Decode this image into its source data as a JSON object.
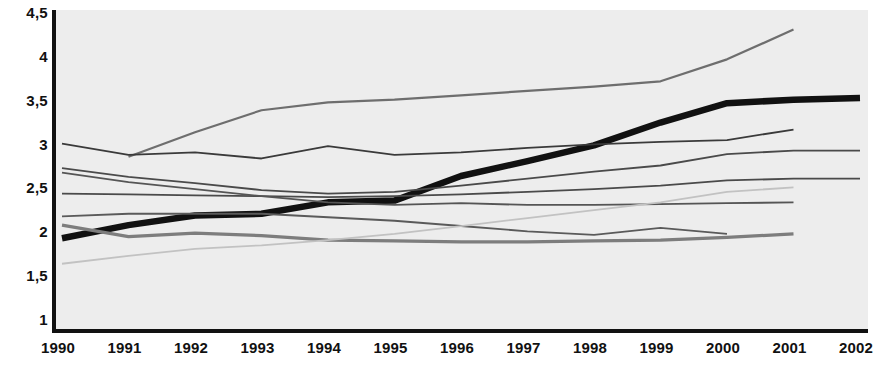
{
  "chart_data": {
    "type": "line",
    "title": "",
    "subtitle": "",
    "xlabel": "",
    "ylabel": "",
    "xlim": [
      1990,
      2002
    ],
    "ylim": [
      1,
      4.5
    ],
    "yticks": [
      1,
      1.5,
      2,
      2.5,
      3,
      3.5,
      4,
      4.5
    ],
    "ytick_labels": [
      "1",
      "1,5",
      "2",
      "2,5",
      "3",
      "3,5",
      "4",
      "4,5"
    ],
    "x": [
      1990,
      1991,
      1992,
      1993,
      1994,
      1995,
      1996,
      1997,
      1998,
      1999,
      2000,
      2001,
      2002
    ],
    "xtick_labels": [
      "1990",
      "1991",
      "1992",
      "1993",
      "1994",
      "1995",
      "1996",
      "1997",
      "1998",
      "1999",
      "2000",
      "2001",
      "2002"
    ],
    "grid": false,
    "legend": "none",
    "decimal_separator": ",",
    "plot_background": "#ededed",
    "axis_color": "#111111",
    "series": [
      {
        "name": "series-rising-top",
        "color": "#6e6e6e",
        "width": 2.2,
        "x": [
          1991,
          1992,
          1993,
          1994,
          1995,
          1996,
          1997,
          1998,
          1999,
          2000,
          2001
        ],
        "values": [
          2.85,
          3.13,
          3.38,
          3.47,
          3.5,
          3.55,
          3.6,
          3.65,
          3.71,
          3.96,
          4.3
        ]
      },
      {
        "name": "series-highlight-thick",
        "color": "#111111",
        "width": 6.5,
        "x": [
          1990,
          1991,
          1992,
          1993,
          1994,
          1995,
          1996,
          1997,
          1998,
          1999,
          2000,
          2001,
          2002
        ],
        "values": [
          1.92,
          2.07,
          2.18,
          2.2,
          2.33,
          2.35,
          2.63,
          2.8,
          2.98,
          3.24,
          3.46,
          3.5,
          3.52
        ]
      },
      {
        "name": "series-upper-wavy",
        "color": "#3a3a3a",
        "width": 1.8,
        "x": [
          1990,
          1991,
          1992,
          1993,
          1994,
          1995,
          1996,
          1997,
          1998,
          1999,
          2000,
          2001
        ],
        "values": [
          3.0,
          2.87,
          2.9,
          2.83,
          2.97,
          2.87,
          2.9,
          2.95,
          2.99,
          3.02,
          3.04,
          3.16
        ]
      },
      {
        "name": "series-upper-flat",
        "color": "#4a4a4a",
        "width": 1.8,
        "x": [
          1990,
          1991,
          1992,
          1993,
          1994,
          1995,
          1996,
          1997,
          1998,
          1999,
          2000,
          2001,
          2002
        ],
        "values": [
          2.72,
          2.62,
          2.55,
          2.47,
          2.43,
          2.45,
          2.52,
          2.6,
          2.68,
          2.75,
          2.88,
          2.92,
          2.92
        ]
      },
      {
        "name": "series-mid-rising",
        "color": "#4a4a4a",
        "width": 1.8,
        "x": [
          1990,
          1991,
          1992,
          1993,
          1994,
          1995,
          1996,
          1997,
          1998,
          1999,
          2000,
          2001,
          2002
        ],
        "values": [
          2.43,
          2.42,
          2.41,
          2.4,
          2.39,
          2.4,
          2.42,
          2.45,
          2.48,
          2.52,
          2.58,
          2.6,
          2.6
        ]
      },
      {
        "name": "series-mid-declining",
        "color": "#555555",
        "width": 1.8,
        "x": [
          1990,
          1991,
          1992,
          1993,
          1994,
          1995,
          1996,
          1997,
          1998,
          1999,
          2000,
          2001
        ],
        "values": [
          2.67,
          2.56,
          2.48,
          2.4,
          2.33,
          2.3,
          2.32,
          2.3,
          2.3,
          2.31,
          2.32,
          2.33
        ]
      },
      {
        "name": "series-low-flat",
        "color": "#5a5a5a",
        "width": 1.8,
        "x": [
          1990,
          1991,
          1992,
          1993,
          1994,
          1995,
          1996,
          1997,
          1998,
          1999,
          2000
        ],
        "values": [
          2.17,
          2.2,
          2.2,
          2.2,
          2.16,
          2.12,
          2.06,
          2.0,
          1.96,
          2.04,
          1.97
        ]
      },
      {
        "name": "series-low-rising-gray",
        "color": "#7d7d7d",
        "width": 3.2,
        "x": [
          1990,
          1991,
          1992,
          1993,
          1994,
          1995,
          1996,
          1997,
          1998,
          1999,
          2000,
          2001
        ],
        "values": [
          2.07,
          1.94,
          1.98,
          1.95,
          1.9,
          1.89,
          1.88,
          1.88,
          1.89,
          1.9,
          1.93,
          1.97
        ]
      },
      {
        "name": "series-faint-rising",
        "color": "#c2c2c2",
        "width": 1.8,
        "x": [
          1990,
          1991,
          1992,
          1993,
          1994,
          1995,
          1996,
          1997,
          1998,
          1999,
          2000,
          2001
        ],
        "values": [
          1.63,
          1.72,
          1.8,
          1.84,
          1.9,
          1.97,
          2.06,
          2.15,
          2.24,
          2.33,
          2.45,
          2.5
        ]
      }
    ]
  }
}
